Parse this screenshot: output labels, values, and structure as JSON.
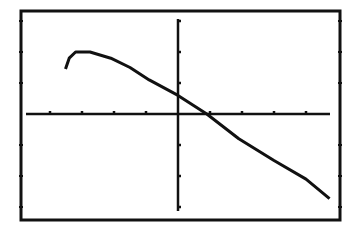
{
  "chart_data": {
    "type": "line",
    "title": "",
    "xlabel": "",
    "ylabel": "",
    "xlim": [
      -5,
      5
    ],
    "ylim": [
      -3.4,
      3.4
    ],
    "x_ticks": [
      -4,
      -3,
      -2,
      -1,
      1,
      2,
      3,
      4
    ],
    "y_ticks": [
      -3,
      -2,
      -1,
      1,
      2,
      3
    ],
    "grid": false,
    "legend": null,
    "series": [
      {
        "name": "curve",
        "points": [
          [
            -3.5,
            1.5
          ],
          [
            -3.4,
            1.8
          ],
          [
            -3.2,
            2.0
          ],
          [
            -2.75,
            2.0
          ],
          [
            -2.1,
            1.8
          ],
          [
            -1.5,
            1.5
          ],
          [
            -0.9,
            1.1
          ],
          [
            0,
            0.6
          ],
          [
            0.9,
            0
          ],
          [
            1.9,
            -0.8
          ],
          [
            3.0,
            -1.5
          ],
          [
            4.0,
            -2.1
          ],
          [
            4.7,
            -2.7
          ]
        ]
      }
    ]
  },
  "style": {
    "ink_color": "#111111",
    "background": "#ffffff"
  }
}
